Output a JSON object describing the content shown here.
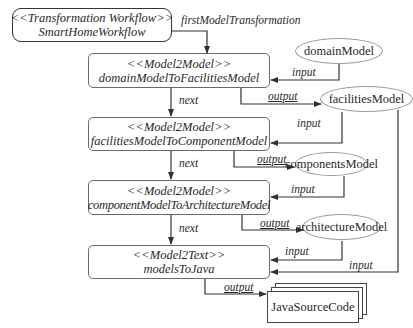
{
  "workflow": {
    "stereotype": "<<Transformation Workflow>>",
    "name": "SmartHomeWorkflow",
    "first_label": "firstModelTransformation"
  },
  "transformations": [
    {
      "stereotype": "<<Model2Model>>",
      "name": "domainModelToFacilitiesModel"
    },
    {
      "stereotype": "<<Model2Model>>",
      "name": "facilitiesModelToComponentModel"
    },
    {
      "stereotype": "<<Model2Model>>",
      "name": "componentModelToArchitectureModel"
    },
    {
      "stereotype": "<<Model2Text>>",
      "name": "modelsToJava"
    }
  ],
  "models": {
    "domain": "domainModel",
    "facilities": "facilitiesModel",
    "components": "componentsModel",
    "architecture": "architectureModel",
    "output_code": "JavaSourceCode"
  },
  "edge_labels": {
    "next": "next",
    "input": "input",
    "output": "output"
  }
}
